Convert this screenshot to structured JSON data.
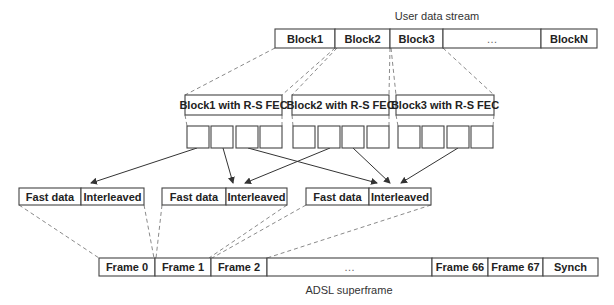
{
  "diagram": {
    "title_top": "User data stream",
    "title_bottom": "ADSL superframe",
    "user_stream": {
      "y": 29,
      "h": 19,
      "cells": [
        {
          "label": "Block1",
          "x": 275,
          "w": 60
        },
        {
          "label": "Block2",
          "x": 335,
          "w": 55
        },
        {
          "label": "Block3",
          "x": 390,
          "w": 53
        },
        {
          "label": "…",
          "x": 443,
          "w": 98
        },
        {
          "label": "BlockN",
          "x": 541,
          "w": 56
        }
      ]
    },
    "fec_blocks": [
      {
        "label": "Block1 with R-S FEC",
        "x": 185,
        "y": 95,
        "w": 97,
        "h": 20,
        "sub_x": [
          187,
          211,
          236,
          260
        ],
        "sub_w": 22
      },
      {
        "label": "Block2 with R-S FEC",
        "x": 292,
        "y": 95,
        "w": 97,
        "h": 20,
        "sub_x": [
          293,
          318,
          342,
          367
        ],
        "sub_w": 22
      },
      {
        "label": "Block3 with R-S FEC",
        "x": 396,
        "y": 95,
        "w": 98,
        "h": 20,
        "sub_x": [
          398,
          422,
          447,
          471
        ],
        "sub_w": 22
      },
      {
        "label_only": true
      }
    ],
    "sub_row": {
      "y": 126,
      "h": 22
    },
    "frames_data": [
      {
        "x": 19,
        "fast_label": "Fast data",
        "interleaved_label": "Interleaved",
        "split": 81,
        "end": 144
      },
      {
        "x": 162,
        "fast_label": "Fast data",
        "interleaved_label": "Interleaved",
        "split": 226,
        "end": 287
      },
      {
        "x": 306,
        "fast_label": "Fast data",
        "interleaved_label": "Interleaved",
        "split": 369,
        "end": 431
      }
    ],
    "frames_row": {
      "y": 188,
      "h": 17
    },
    "superframe": {
      "y": 258,
      "h": 18,
      "cells": [
        {
          "label": "Frame 0",
          "x": 99,
          "w": 56
        },
        {
          "label": "Frame 1",
          "x": 155,
          "w": 56
        },
        {
          "label": "Frame 2",
          "x": 211,
          "w": 56
        },
        {
          "label": "…",
          "x": 267,
          "w": 165
        },
        {
          "label": "Frame 66",
          "x": 432,
          "w": 56
        },
        {
          "label": "Frame 67",
          "x": 488,
          "w": 55
        },
        {
          "label": "Synch",
          "x": 543,
          "w": 55
        }
      ]
    }
  }
}
